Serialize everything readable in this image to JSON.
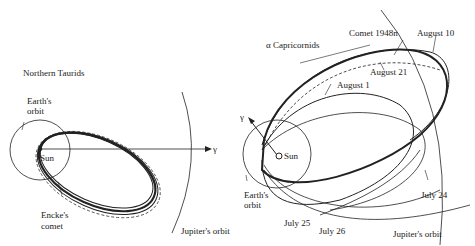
{
  "left_panel": {
    "title": "Northern Taurids",
    "labels": {
      "earth_orbit": [
        "Earth's",
        "orbit"
      ],
      "sun": "Sun",
      "gamma": "γ",
      "comet": [
        "Encke's",
        "comet"
      ],
      "jupiter": "Jupiter's orbit"
    }
  },
  "right_panel": {
    "title": "α Capricornids",
    "labels": {
      "comet": "Comet 1948n",
      "aug10": "August 10",
      "aug21": "August 21",
      "aug1": "August 1",
      "gamma": "γ",
      "sun": "Sun",
      "earth_orbit": [
        "Earth's",
        "orbit"
      ],
      "jul24": "July 24",
      "jul25": "July 25",
      "jul26": "July 26",
      "jupiter": "Jupiter's orbit"
    }
  }
}
